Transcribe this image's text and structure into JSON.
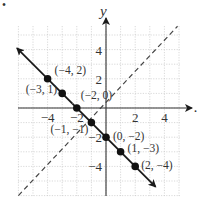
{
  "chart_data": {
    "type": "line",
    "title": "",
    "xlabel": "x",
    "ylabel": "y",
    "xlim": [
      -6,
      5
    ],
    "ylim": [
      -6,
      6
    ],
    "grid": true,
    "x_ticks": [
      "-4",
      "-2",
      "2",
      "4"
    ],
    "y_ticks": [
      "4",
      "2",
      "-2",
      "-4"
    ],
    "series": [
      {
        "name": "y = -x - 2",
        "style": "solid",
        "color": "#1a1a1a",
        "arrows": "both",
        "points": [
          {
            "x": -4,
            "y": 2,
            "label": "(−4, 2)"
          },
          {
            "x": -3,
            "y": 1,
            "label": "(−3, 1)"
          },
          {
            "x": -2,
            "y": 0,
            "label": "(−2, 0)"
          },
          {
            "x": -1,
            "y": -1,
            "label": "(−1, −1)"
          },
          {
            "x": 0,
            "y": -2,
            "label": "(0, −2)"
          },
          {
            "x": 1,
            "y": -3,
            "label": "(1, −3)"
          },
          {
            "x": 2,
            "y": -4,
            "label": "(2, −4)"
          }
        ]
      },
      {
        "name": "y = x",
        "style": "dashed",
        "color": "#444444",
        "arrows": "none"
      }
    ]
  },
  "labels": {
    "corner_mark": "•",
    "y_axis": "y",
    "x_axis": "x"
  }
}
